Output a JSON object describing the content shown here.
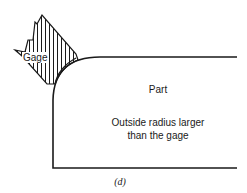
{
  "diagram": {
    "gage_label": "Gage",
    "part_label": "Part",
    "note_line1": "Outside radius larger",
    "note_line2": "than the gage",
    "caption": "(d)",
    "line_color": "#1a1a1a",
    "background": "#ffffff"
  }
}
